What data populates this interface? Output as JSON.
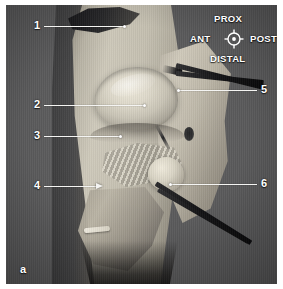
{
  "figure": {
    "panel_letter": "a",
    "background_color": "#5a5a5b",
    "border_color": "#ffffff"
  },
  "compass": {
    "name": "orientation-compass",
    "proximal": "PROX",
    "distal": "DISTAL",
    "anterior": "ANT",
    "posterior": "POST",
    "glyph": "crosshair-circle-icon",
    "color": "#ffffff"
  },
  "callouts": [
    {
      "id": "1",
      "label": "1",
      "side": "left",
      "label_x": 28,
      "label_y": 15,
      "line_x": 38,
      "line_y": 21,
      "line_w": 80,
      "marker": "dot",
      "marker_x": 117,
      "marker_y": 20
    },
    {
      "id": "2",
      "label": "2",
      "side": "left",
      "label_x": 28,
      "label_y": 94,
      "line_x": 38,
      "line_y": 100,
      "line_w": 100,
      "marker": "dot",
      "marker_x": 137,
      "marker_y": 99
    },
    {
      "id": "3",
      "label": "3",
      "side": "left",
      "label_x": 28,
      "label_y": 125,
      "line_x": 38,
      "line_y": 131,
      "line_w": 76,
      "marker": "dot",
      "marker_x": 113,
      "marker_y": 130
    },
    {
      "id": "4",
      "label": "4",
      "side": "left",
      "label_x": 28,
      "label_y": 175,
      "line_x": 38,
      "line_y": 181,
      "line_w": 52,
      "marker": "arrow",
      "marker_x": 90,
      "marker_y": 178
    },
    {
      "id": "5",
      "label": "5",
      "side": "right",
      "label_x": 255,
      "label_y": 79,
      "line_x": 173,
      "line_y": 85,
      "line_w": 78,
      "marker": "dot",
      "marker_x": 171,
      "marker_y": 84
    },
    {
      "id": "6",
      "label": "6",
      "side": "right",
      "label_x": 255,
      "label_y": 173,
      "line_x": 165,
      "line_y": 179,
      "line_w": 86,
      "marker": "dot",
      "marker_x": 163,
      "marker_y": 178
    }
  ],
  "specimen": {
    "type": "anatomical-dissection-photograph",
    "tissue_color": "#c4bfb0",
    "highlight_color": "#ece7d8",
    "shadow_color": "#3c3c3d",
    "instrument_color": "#0c0c0d"
  }
}
